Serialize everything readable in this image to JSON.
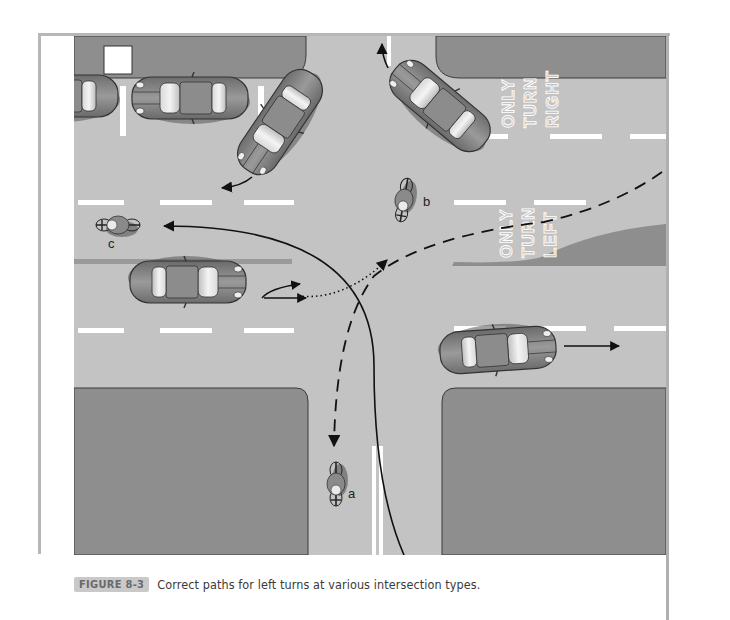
{
  "figure": {
    "label": "FIGURE 8-3",
    "caption": "Correct paths for left turns at various intersection types."
  },
  "diagram": {
    "lane_signs": [
      {
        "lines": [
          "ONLY",
          "TURN",
          "RIGHT"
        ]
      },
      {
        "lines": [
          "ONLY",
          "TURN",
          "LEFT"
        ]
      }
    ],
    "cyclists": [
      {
        "label": "a"
      },
      {
        "label": "b"
      },
      {
        "label": "c"
      }
    ],
    "colors": {
      "road": "#c3c3c3",
      "block": "#8e8e8e",
      "median": "#9a9a9a",
      "lane_marking": "#ffffff",
      "car_body": "#8a8a8a",
      "path_line": "#111111",
      "caption_tag_bg": "#c9c9c9"
    }
  }
}
